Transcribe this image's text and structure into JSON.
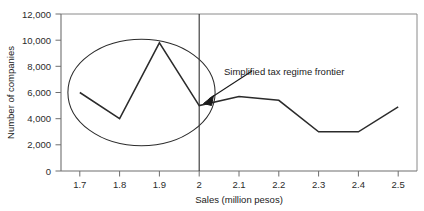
{
  "chart_data": {
    "type": "line",
    "title": "",
    "xlabel": "Sales (million pesos)",
    "ylabel": "Number of companies",
    "xlim": [
      1.65,
      2.55
    ],
    "ylim": [
      0,
      12000
    ],
    "grid": false,
    "legend": "none",
    "x_ticks": [
      "1.7",
      "1.8",
      "1.9",
      "2",
      "2.1",
      "2.2",
      "2.3",
      "2.4",
      "2.5"
    ],
    "y_ticks": [
      "0",
      "2,000",
      "4,000",
      "6,000",
      "8,000",
      "10,000",
      "12,000"
    ],
    "x": [
      1.7,
      1.8,
      1.9,
      2.0,
      2.1,
      2.2,
      2.3,
      2.4,
      2.5
    ],
    "values": [
      6000,
      4000,
      9800,
      5000,
      5700,
      5400,
      3000,
      3000,
      4900
    ],
    "series": [
      {
        "name": "Number of companies",
        "values": [
          6000,
          4000,
          9800,
          5000,
          5700,
          5400,
          3000,
          3000,
          4900
        ]
      }
    ],
    "annotations": [
      {
        "name": "frontier-label",
        "text": "Simplified tax regime frontier",
        "type": "arrow-callout",
        "points_to_x": 2.0,
        "points_to_y": 5000
      },
      {
        "name": "frontier-line",
        "type": "vertical-line",
        "x": 2.0
      },
      {
        "name": "spike-highlight-ellipse",
        "type": "ellipse",
        "center_x": 1.855,
        "center_y": 6000,
        "width_x": 0.185,
        "height_y": 8150
      }
    ]
  },
  "axis": {
    "x_label": "Sales (million pesos)",
    "y_label": "Number of companies"
  },
  "ticks": {
    "x": [
      "1.7",
      "1.8",
      "1.9",
      "2",
      "2.1",
      "2.2",
      "2.3",
      "2.4",
      "2.5"
    ],
    "y": [
      "12,000",
      "10,000",
      "8,000",
      "6,000",
      "4,000",
      "2,000",
      "0"
    ]
  },
  "annotation": {
    "frontier_text": "Simplified tax regime frontier"
  },
  "colors": {
    "line": "#2b2b2b",
    "axis": "#6e6e6e",
    "frame": "#8a8a8a",
    "text": "#1a1a1a",
    "background": "#ffffff"
  }
}
